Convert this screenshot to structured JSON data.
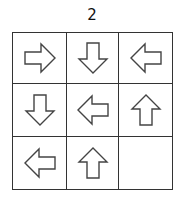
{
  "title": "2",
  "grid": {
    "rows": 3,
    "cols": 3,
    "cells": [
      [
        "right",
        "down",
        "left"
      ],
      [
        "down",
        "left",
        "up"
      ],
      [
        "left",
        "up",
        ""
      ]
    ]
  }
}
